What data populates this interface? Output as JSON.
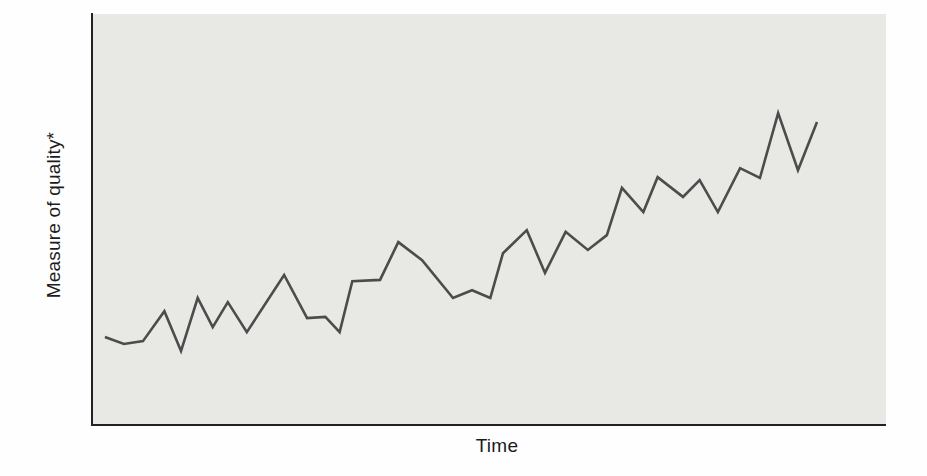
{
  "figure": {
    "title": ""
  },
  "chart_data": {
    "type": "line",
    "title": "",
    "xlabel": "Time",
    "ylabel": "Measure of quality*",
    "x_ticks": [],
    "y_ticks": [],
    "xlim": [
      0,
      100
    ],
    "ylim": [
      0,
      100
    ],
    "grid": false,
    "legend": false,
    "plot_bg_color": "#e8e8e5",
    "line_color": "#4c4c4c",
    "axis_color": "#222222",
    "label_color": "#1c1c1c",
    "note": "Conceptual trend chart; axes are unscaled, values normalized 0-100 of plot height/width",
    "series": [
      {
        "name": "measure-of-quality-over-time",
        "points": [
          [
            1.5,
            21.4
          ],
          [
            3.9,
            19.7
          ],
          [
            6.3,
            20.4
          ],
          [
            9.0,
            27.7
          ],
          [
            11.1,
            18.0
          ],
          [
            13.2,
            30.9
          ],
          [
            15.1,
            23.8
          ],
          [
            17.0,
            29.9
          ],
          [
            19.4,
            22.6
          ],
          [
            24.1,
            36.5
          ],
          [
            27.0,
            26.0
          ],
          [
            29.3,
            26.3
          ],
          [
            31.1,
            22.6
          ],
          [
            32.7,
            35.0
          ],
          [
            36.2,
            35.3
          ],
          [
            38.5,
            44.5
          ],
          [
            41.5,
            40.1
          ],
          [
            45.4,
            30.9
          ],
          [
            47.8,
            32.8
          ],
          [
            50.1,
            30.9
          ],
          [
            51.7,
            41.8
          ],
          [
            54.7,
            47.4
          ],
          [
            57.0,
            37.0
          ],
          [
            59.6,
            47.0
          ],
          [
            62.4,
            42.6
          ],
          [
            64.8,
            46.2
          ],
          [
            66.7,
            57.7
          ],
          [
            69.4,
            51.8
          ],
          [
            71.2,
            60.3
          ],
          [
            74.4,
            55.5
          ],
          [
            76.5,
            59.6
          ],
          [
            78.8,
            51.8
          ],
          [
            81.6,
            62.5
          ],
          [
            84.1,
            60.1
          ],
          [
            86.4,
            75.9
          ],
          [
            88.9,
            62.0
          ],
          [
            91.3,
            73.7
          ]
        ]
      }
    ]
  }
}
